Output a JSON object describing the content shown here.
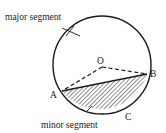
{
  "diagram": {
    "labels": {
      "major": "major segment",
      "minor": "minor segment",
      "center": "O",
      "pointA": "A",
      "pointB": "B",
      "pointC": "C"
    },
    "colors": {
      "stroke": "#1a1a1a",
      "hatch": "#333333",
      "background": "#ffffff"
    }
  }
}
